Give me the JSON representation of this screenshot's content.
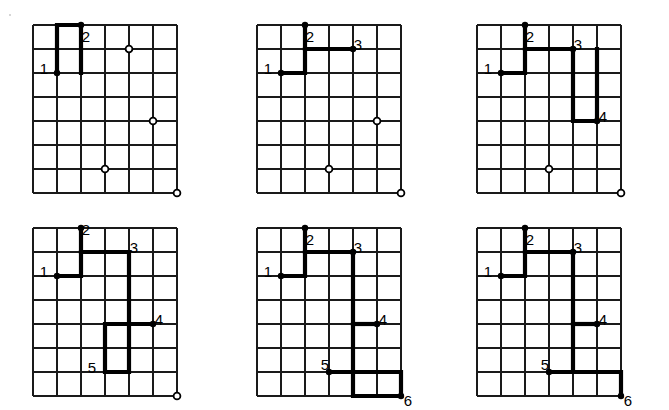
{
  "figure": {
    "title": "",
    "panel_count": 6,
    "grid": {
      "columns": 6,
      "rows": 7,
      "cell_size": 24,
      "line_color": "#1a1a1a",
      "line_width": 1.6,
      "border_width": 2.0,
      "background": "#ffffff"
    },
    "style": {
      "path_color": "#000000",
      "path_width": 4.2,
      "vertex_dot_color": "#000000",
      "vertex_dot_radius": 3.2,
      "open_marker_outer_radius": 3.4,
      "open_marker_inner_radius": 1.5,
      "open_marker_fill": "#ffffff",
      "label_color": "#000000",
      "label_font_size": 15
    }
  },
  "panels": [
    {
      "id": "panel-1",
      "name": "step-1",
      "origin": {
        "x": 33,
        "y": 25
      },
      "path": [
        [
          1,
          2
        ],
        [
          1,
          1
        ],
        [
          1,
          0
        ],
        [
          2,
          0
        ],
        [
          2,
          1
        ],
        [
          2,
          2
        ]
      ],
      "vertices": [
        {
          "col": 1,
          "row": 2,
          "label": "1",
          "label_dx": -13,
          "label_dy": -3,
          "dot": true
        },
        {
          "col": 2,
          "row": 0,
          "label": "2",
          "label_dx": 5,
          "label_dy": 13,
          "dot": true
        }
      ],
      "open_markers": [
        {
          "col": 4,
          "row": 1
        },
        {
          "col": 5,
          "row": 4
        },
        {
          "col": 3,
          "row": 6
        },
        {
          "col": 6,
          "row": 7
        }
      ]
    },
    {
      "id": "panel-2",
      "name": "step-2",
      "origin": {
        "x": 257,
        "y": 25
      },
      "path": [
        [
          1,
          2
        ],
        [
          2,
          2
        ],
        [
          2,
          1
        ],
        [
          2,
          0
        ]
      ],
      "path2": [
        [
          2,
          1
        ],
        [
          3,
          1
        ],
        [
          4,
          1
        ]
      ],
      "vertices": [
        {
          "col": 1,
          "row": 2,
          "label": "1",
          "label_dx": -13,
          "label_dy": -3,
          "dot": true
        },
        {
          "col": 2,
          "row": 0,
          "label": "2",
          "label_dx": 5,
          "label_dy": 13,
          "dot": true
        },
        {
          "col": 4,
          "row": 1,
          "label": "3",
          "label_dx": 5,
          "label_dy": -3,
          "dot": true
        }
      ],
      "open_markers": [
        {
          "col": 5,
          "row": 4
        },
        {
          "col": 3,
          "row": 6
        },
        {
          "col": 6,
          "row": 7
        }
      ]
    },
    {
      "id": "panel-3",
      "name": "step-3",
      "origin": {
        "x": 477,
        "y": 25
      },
      "path": [
        [
          1,
          2
        ],
        [
          2,
          2
        ],
        [
          2,
          1
        ],
        [
          2,
          0
        ]
      ],
      "path2": [
        [
          2,
          1
        ],
        [
          3,
          1
        ],
        [
          4,
          1
        ],
        [
          4,
          2
        ],
        [
          4,
          3
        ],
        [
          4,
          4
        ],
        [
          5,
          4
        ],
        [
          5,
          3
        ],
        [
          5,
          2
        ],
        [
          5,
          1
        ]
      ],
      "vertices": [
        {
          "col": 1,
          "row": 2,
          "label": "1",
          "label_dx": -13,
          "label_dy": -3,
          "dot": true
        },
        {
          "col": 2,
          "row": 0,
          "label": "2",
          "label_dx": 5,
          "label_dy": 13,
          "dot": true
        },
        {
          "col": 4,
          "row": 1,
          "label": "3",
          "label_dx": 5,
          "label_dy": -3,
          "dot": true
        },
        {
          "col": 5,
          "row": 4,
          "label": "4",
          "label_dx": 6,
          "label_dy": -3,
          "dot": true
        }
      ],
      "open_markers": [
        {
          "col": 3,
          "row": 6
        },
        {
          "col": 6,
          "row": 7
        }
      ]
    },
    {
      "id": "panel-4",
      "name": "step-4",
      "origin": {
        "x": 33,
        "y": 228
      },
      "path": [
        [
          1,
          2
        ],
        [
          2,
          2
        ],
        [
          2,
          1
        ],
        [
          2,
          0
        ]
      ],
      "path2": [
        [
          2,
          1
        ],
        [
          3,
          1
        ],
        [
          4,
          1
        ],
        [
          4,
          2
        ],
        [
          4,
          3
        ],
        [
          4,
          4
        ],
        [
          4,
          5
        ],
        [
          4,
          6
        ],
        [
          3,
          6
        ],
        [
          3,
          5
        ],
        [
          3,
          4
        ],
        [
          4,
          4
        ],
        [
          5,
          4
        ]
      ],
      "vertices": [
        {
          "col": 1,
          "row": 2,
          "label": "1",
          "label_dx": -13,
          "label_dy": -3,
          "dot": true
        },
        {
          "col": 2,
          "row": 0,
          "label": "2",
          "label_dx": 5,
          "label_dy": 3,
          "dot": true
        },
        {
          "col": 4,
          "row": 1,
          "label": "3",
          "label_dx": 5,
          "label_dy": -3,
          "dot": false
        },
        {
          "col": 5,
          "row": 4,
          "label": "4",
          "label_dx": 6,
          "label_dy": -3,
          "dot": true
        },
        {
          "col": 3,
          "row": 6,
          "label": "5",
          "label_dx": -13,
          "label_dy": -3,
          "dot": false
        }
      ],
      "open_markers": [
        {
          "col": 6,
          "row": 7
        }
      ]
    },
    {
      "id": "panel-5",
      "name": "step-5",
      "origin": {
        "x": 257,
        "y": 228
      },
      "path": [
        [
          1,
          2
        ],
        [
          2,
          2
        ],
        [
          2,
          1
        ],
        [
          2,
          0
        ]
      ],
      "path2": [
        [
          2,
          1
        ],
        [
          3,
          1
        ],
        [
          4,
          1
        ],
        [
          4,
          2
        ],
        [
          4,
          3
        ],
        [
          4,
          4
        ],
        [
          4,
          5
        ],
        [
          4,
          6
        ],
        [
          4,
          7
        ],
        [
          5,
          7
        ],
        [
          6,
          7
        ],
        [
          6,
          6
        ],
        [
          5,
          6
        ],
        [
          4,
          6
        ],
        [
          3,
          6
        ]
      ],
      "path3": [
        [
          4,
          4
        ],
        [
          5,
          4
        ]
      ],
      "vertices": [
        {
          "col": 1,
          "row": 2,
          "label": "1",
          "label_dx": -13,
          "label_dy": -3,
          "dot": true
        },
        {
          "col": 2,
          "row": 0,
          "label": "2",
          "label_dx": 5,
          "label_dy": 13,
          "dot": true
        },
        {
          "col": 4,
          "row": 1,
          "label": "3",
          "label_dx": 5,
          "label_dy": -3,
          "dot": true
        },
        {
          "col": 5,
          "row": 4,
          "label": "4",
          "label_dx": 6,
          "label_dy": -3,
          "dot": true
        },
        {
          "col": 3,
          "row": 6,
          "label": "5",
          "label_dx": -4,
          "label_dy": -6,
          "dot": true
        },
        {
          "col": 6,
          "row": 7,
          "label": "6",
          "label_dx": 7,
          "label_dy": 6,
          "dot": true
        }
      ],
      "open_markers": []
    },
    {
      "id": "panel-6",
      "name": "step-6",
      "origin": {
        "x": 477,
        "y": 228
      },
      "path": [
        [
          1,
          2
        ],
        [
          2,
          2
        ],
        [
          2,
          1
        ],
        [
          2,
          0
        ]
      ],
      "path2": [
        [
          2,
          1
        ],
        [
          3,
          1
        ],
        [
          4,
          1
        ],
        [
          4,
          2
        ],
        [
          4,
          3
        ],
        [
          4,
          4
        ],
        [
          4,
          5
        ],
        [
          4,
          6
        ],
        [
          3,
          6
        ]
      ],
      "path3": [
        [
          4,
          4
        ],
        [
          5,
          4
        ]
      ],
      "path4": [
        [
          4,
          6
        ],
        [
          5,
          6
        ],
        [
          6,
          6
        ],
        [
          6,
          7
        ]
      ],
      "vertices": [
        {
          "col": 1,
          "row": 2,
          "label": "1",
          "label_dx": -13,
          "label_dy": -3,
          "dot": true
        },
        {
          "col": 2,
          "row": 0,
          "label": "2",
          "label_dx": 5,
          "label_dy": 13,
          "dot": true
        },
        {
          "col": 4,
          "row": 1,
          "label": "3",
          "label_dx": 5,
          "label_dy": -3,
          "dot": true
        },
        {
          "col": 5,
          "row": 4,
          "label": "4",
          "label_dx": 6,
          "label_dy": -3,
          "dot": true
        },
        {
          "col": 3,
          "row": 6,
          "label": "5",
          "label_dx": -4,
          "label_dy": -6,
          "dot": true
        },
        {
          "col": 6,
          "row": 7,
          "label": "6",
          "label_dx": 7,
          "label_dy": 6,
          "dot": true
        }
      ],
      "open_markers": []
    }
  ],
  "specks": [
    {
      "x": 9,
      "y": 14
    }
  ]
}
